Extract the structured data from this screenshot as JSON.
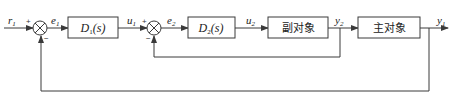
{
  "diagram": {
    "type": "cascade-control-block-diagram",
    "signals": {
      "r1": {
        "base": "r",
        "sub": "1"
      },
      "e1": {
        "base": "e",
        "sub": "1"
      },
      "u1": {
        "base": "u",
        "sub": "1"
      },
      "e2": {
        "base": "e",
        "sub": "2"
      },
      "u2": {
        "base": "u",
        "sub": "2"
      },
      "y2": {
        "base": "y",
        "sub": "2"
      },
      "y1": {
        "base": "y",
        "sub": "1"
      }
    },
    "blocks": {
      "d1": {
        "base": "D",
        "sub": "1",
        "arg": "(s)"
      },
      "d2": {
        "base": "D",
        "sub": "2",
        "arg": "(s)"
      },
      "secondary_plant": "副对象",
      "primary_plant": "主对象"
    },
    "summing_junctions": {
      "sj1": {
        "plus": "+",
        "minus": "−"
      },
      "sj2": {
        "plus": "+",
        "minus": "−"
      }
    },
    "colors": {
      "line": "#3a3a3a",
      "text": "#222222",
      "background": "#ffffff"
    }
  }
}
